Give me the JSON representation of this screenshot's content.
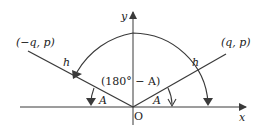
{
  "diagram": {
    "type": "coordinate-geometry",
    "axes": {
      "x_label": "x",
      "y_label": "y",
      "origin_label": "O"
    },
    "points": {
      "left": "(−q, p)",
      "right": "(q, p)"
    },
    "segments": {
      "left_hyp": "h",
      "right_hyp": "h"
    },
    "angles": {
      "left_angle": "A",
      "right_angle": "A",
      "obtuse_angle": "(180° − A)"
    },
    "colors": {
      "line": "#3a3a3a",
      "text": "#222222",
      "background": "#ffffff"
    }
  }
}
